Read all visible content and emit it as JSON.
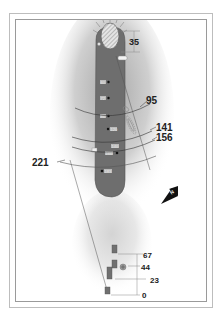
{
  "hole_map": {
    "green_depth": "35",
    "fairway_markers": [
      "60",
      "72",
      "86",
      "120",
      "140",
      "160",
      "183"
    ],
    "distance_arcs": [
      {
        "label": "95"
      },
      {
        "label": "141"
      },
      {
        "label": "156"
      },
      {
        "label": "221"
      }
    ],
    "north_label": "N",
    "tee_distances": [
      "67",
      "44",
      "23",
      "0"
    ],
    "colors": {
      "fairway": "#6e6e6e",
      "rough": "#d0d0d0",
      "green_hatch": "#bcbcbc",
      "tee": "#707070",
      "frame": "#9a9a9a"
    }
  }
}
